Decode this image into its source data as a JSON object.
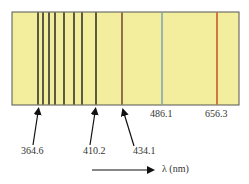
{
  "diagram": {
    "background_color": "#f3ee9e",
    "border_color": "#555555",
    "lines": [
      {
        "x": 38,
        "color": "#1a1a1a",
        "label": ""
      },
      {
        "x": 43,
        "color": "#1a1a1a",
        "label": ""
      },
      {
        "x": 49,
        "color": "#1a1a1a",
        "label": ""
      },
      {
        "x": 55,
        "color": "#1a1a1a",
        "label": ""
      },
      {
        "x": 64,
        "color": "#1a1a1a",
        "label": ""
      },
      {
        "x": 74,
        "color": "#1a1a1a",
        "label": ""
      },
      {
        "x": 82,
        "color": "#1a1a1a",
        "label": ""
      },
      {
        "x": 96,
        "color": "#1a1a1a",
        "label": ""
      },
      {
        "x": 122,
        "color": "#6b3a25",
        "label": ""
      },
      {
        "x": 162,
        "color": "#6fa0b8",
        "label": "486.1"
      },
      {
        "x": 217,
        "color": "#c0461f",
        "label": "656.3"
      }
    ],
    "pointer_labels": [
      {
        "text": "364.6",
        "x": 33
      },
      {
        "text": "410.2",
        "x": 95
      },
      {
        "text": "434.1",
        "x": 145
      }
    ],
    "direct_labels": [
      {
        "text": "486.1",
        "x": 162
      },
      {
        "text": "656.3",
        "x": 217
      }
    ],
    "axis_label": "λ (nm)"
  }
}
